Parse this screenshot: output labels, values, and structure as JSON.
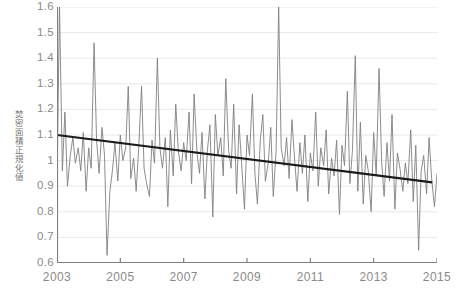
{
  "axes": {
    "ylabel": "焚密面積正規化値",
    "ytick_labels": [
      "1.6",
      "1.5",
      "1.4",
      "1.3",
      "1.2",
      "1.1",
      "1",
      "0.9",
      "0.8",
      "0.7",
      "0.6"
    ],
    "xtick_labels": [
      "2003",
      "2005",
      "2007",
      "2009",
      "2011",
      "2013",
      "2015"
    ]
  },
  "colors": {
    "series_line": "#808080",
    "trend_line": "#1a1a1a",
    "axis": "#808080",
    "gridline": "#e8e8ec",
    "tick_text": "#8a8a8a"
  },
  "chart_data": {
    "type": "line",
    "title": "",
    "xlabel": "",
    "ylabel": "焚密面積正規化値",
    "xlim": [
      2003.0,
      2015.0
    ],
    "ylim": [
      0.6,
      1.6
    ],
    "grid": true,
    "legend": "none",
    "xtick_values": [
      2003,
      2005,
      2007,
      2009,
      2011,
      2013,
      2015
    ],
    "ytick_values": [
      0.6,
      0.7,
      0.8,
      0.9,
      1.0,
      1.1,
      1.2,
      1.3,
      1.4,
      1.5,
      1.6
    ],
    "series": [
      {
        "name": "normalized burned area",
        "style": "thin-line",
        "color": "#808080",
        "x": [
          2003.0,
          2003.08,
          2003.17,
          2003.25,
          2003.33,
          2003.42,
          2003.5,
          2003.58,
          2003.67,
          2003.75,
          2003.83,
          2003.92,
          2004.0,
          2004.08,
          2004.17,
          2004.25,
          2004.33,
          2004.42,
          2004.5,
          2004.58,
          2004.67,
          2004.75,
          2004.83,
          2004.92,
          2005.0,
          2005.08,
          2005.17,
          2005.25,
          2005.33,
          2005.42,
          2005.5,
          2005.58,
          2005.67,
          2005.75,
          2005.83,
          2005.92,
          2006.0,
          2006.08,
          2006.17,
          2006.25,
          2006.33,
          2006.42,
          2006.5,
          2006.58,
          2006.67,
          2006.75,
          2006.83,
          2006.92,
          2007.0,
          2007.08,
          2007.17,
          2007.25,
          2007.33,
          2007.42,
          2007.5,
          2007.58,
          2007.67,
          2007.75,
          2007.83,
          2007.92,
          2008.0,
          2008.08,
          2008.17,
          2008.25,
          2008.33,
          2008.42,
          2008.5,
          2008.58,
          2008.67,
          2008.75,
          2008.83,
          2008.92,
          2009.0,
          2009.08,
          2009.17,
          2009.25,
          2009.33,
          2009.42,
          2009.5,
          2009.58,
          2009.67,
          2009.75,
          2009.83,
          2009.92,
          2010.0,
          2010.08,
          2010.17,
          2010.25,
          2010.33,
          2010.42,
          2010.5,
          2010.58,
          2010.67,
          2010.75,
          2010.83,
          2010.92,
          2011.0,
          2011.08,
          2011.17,
          2011.25,
          2011.33,
          2011.42,
          2011.5,
          2011.58,
          2011.67,
          2011.75,
          2011.83,
          2011.92,
          2012.0,
          2012.08,
          2012.17,
          2012.25,
          2012.33,
          2012.42,
          2012.5,
          2012.58,
          2012.67,
          2012.75,
          2012.83,
          2012.92,
          2013.0,
          2013.08,
          2013.17,
          2013.25,
          2013.33,
          2013.42,
          2013.5,
          2013.58,
          2013.67,
          2013.75,
          2013.83,
          2013.92,
          2014.0,
          2014.08,
          2014.17,
          2014.25,
          2014.33,
          2014.42,
          2014.5,
          2014.58,
          2014.67,
          2014.75,
          2014.83,
          2014.92,
          2015.0
        ],
        "y": [
          0.93,
          1.6,
          0.96,
          1.19,
          0.9,
          1.02,
          1.09,
          0.99,
          1.05,
          0.96,
          1.11,
          0.88,
          1.05,
          0.97,
          1.46,
          1.08,
          0.95,
          1.13,
          1.02,
          0.63,
          0.88,
          0.96,
          1.07,
          0.92,
          1.1,
          1.0,
          1.05,
          1.29,
          0.93,
          1.01,
          0.88,
          1.05,
          1.29,
          0.97,
          0.91,
          0.86,
          1.08,
          0.99,
          1.4,
          1.05,
          0.97,
          1.09,
          0.82,
          1.12,
          0.94,
          1.22,
          1.04,
          0.96,
          1.07,
          1.0,
          1.19,
          0.91,
          1.26,
          1.03,
          0.95,
          1.11,
          0.85,
          1.04,
          1.14,
          0.78,
          1.18,
          1.02,
          1.09,
          0.94,
          1.32,
          1.04,
          0.97,
          1.22,
          0.87,
          1.14,
          0.99,
          0.81,
          1.1,
          1.02,
          1.26,
          0.95,
          0.83,
          1.08,
          1.18,
          0.92,
          0.99,
          1.13,
          0.86,
          1.04,
          1.6,
          1.05,
          0.98,
          1.09,
          0.93,
          1.16,
          1.01,
          0.88,
          1.07,
          0.95,
          1.1,
          0.84,
          1.03,
          0.96,
          1.19,
          0.9,
          1.05,
          0.98,
          1.12,
          0.87,
          1.01,
          0.94,
          1.08,
          0.79,
          1.06,
          0.98,
          1.27,
          0.91,
          1.04,
          1.41,
          0.88,
          1.15,
          0.83,
          1.02,
          0.96,
          0.8,
          1.11,
          0.94,
          1.36,
          1.0,
          0.86,
          1.07,
          0.92,
          1.18,
          0.81,
          1.03,
          0.97,
          0.88,
          0.99,
          0.91,
          1.12,
          0.84,
          1.06,
          0.65,
          0.96,
          1.02,
          0.87,
          1.09,
          0.93,
          0.82,
          0.95
        ]
      }
    ],
    "trendline": {
      "name": "linear trend",
      "style": "thick-line",
      "color": "#1a1a1a",
      "x": [
        2003.0,
        2014.85
      ],
      "y": [
        1.1,
        0.915
      ],
      "slope_per_year": -0.0156
    }
  }
}
